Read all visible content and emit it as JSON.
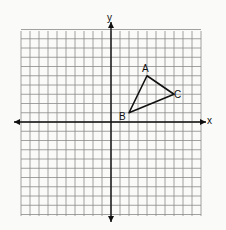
{
  "diagram": {
    "type": "coordinate-plane",
    "grid": {
      "x_min": -10,
      "x_max": 10,
      "y_min": -10,
      "y_max": 10,
      "step": 1
    },
    "axes": {
      "x_label": "x",
      "y_label": "y"
    },
    "triangle": {
      "vertices": [
        {
          "label": "A",
          "x": 4,
          "y": 5
        },
        {
          "label": "B",
          "x": 2,
          "y": 1
        },
        {
          "label": "C",
          "x": 7,
          "y": 3
        }
      ]
    },
    "colors": {
      "grid": "#8a8a8a",
      "axis": "#111111",
      "shape": "#111111",
      "background": "#fafaf8"
    }
  }
}
